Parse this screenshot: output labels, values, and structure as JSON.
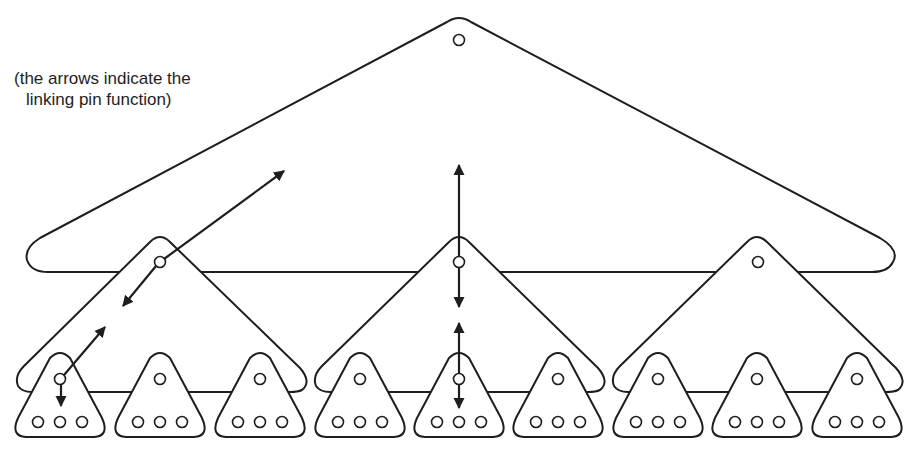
{
  "diagram": {
    "type": "linking-pin organization diagram",
    "caption": {
      "line1": "(the arrows indicate the",
      "line2": "linking pin function)"
    },
    "colors": {
      "stroke": "#1e1e1e",
      "background": "#ffffff"
    },
    "levels": [
      {
        "name": "top",
        "group_count": 1,
        "description": "Top-level group (large triangle) with one pin at apex"
      },
      {
        "name": "middle",
        "group_count": 3,
        "description": "Three middle-level groups, each with a linking pin at apex that is also a member of the top group"
      },
      {
        "name": "bottom",
        "group_count": 9,
        "members_per_group": 3,
        "description": "Nine bottom-level work groups, each with one leader pin and three member pins"
      }
    ],
    "arrows": [
      {
        "id": "left-diagonal-upper",
        "kind": "double-headed",
        "from": "middle-group-1-pin",
        "to": "top-group"
      },
      {
        "id": "left-diagonal-lower",
        "kind": "double-headed",
        "from": "bottom-group-1-pin",
        "to": "middle-group-1"
      },
      {
        "id": "center-vertical-upper",
        "kind": "double-headed",
        "from": "middle-group-2-pin",
        "to": "top-group"
      },
      {
        "id": "center-vertical-lower",
        "kind": "double-headed",
        "from": "bottom-group-5-pin",
        "to": "middle-group-2"
      }
    ]
  }
}
